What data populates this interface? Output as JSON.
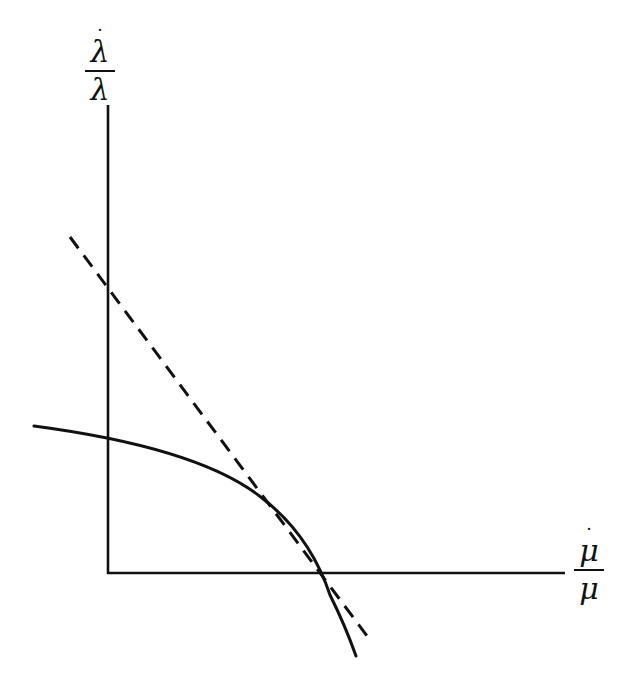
{
  "diagram": {
    "y_axis": {
      "label_numerator": "λ",
      "label_denominator": "λ",
      "label_dot": "˙",
      "label_text": "λ̇/λ"
    },
    "x_axis": {
      "label_numerator": "μ",
      "label_denominator": "μ",
      "label_dot": "˙",
      "label_text": "μ̇/μ"
    },
    "colors": {
      "stroke": "#111111",
      "background": "#ffffff"
    },
    "geometry": {
      "origin": [
        108,
        573
      ],
      "y_axis_top": [
        108,
        105
      ],
      "x_axis_right": [
        565,
        573
      ],
      "curve_path": "M 34 426 Q 200 448 262 498 Q 310 535 330 595 Q 345 625 356 656",
      "dashed_line": [
        [
          70,
          237
        ],
        [
          370,
          640
        ]
      ],
      "tangent_point": [
        316,
        573
      ],
      "dashed_y_intercept": [
        108,
        287
      ],
      "curve_y_intercept": [
        108,
        441
      ]
    }
  }
}
